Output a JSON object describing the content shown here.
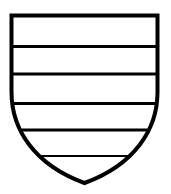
{
  "figure": {
    "name": "heraldic-shield",
    "title": "Heraldic shield with horizontal bars",
    "blazon_description": "Escutcheon barry of seven",
    "background_color": "#ffffff",
    "field_color": "#ffffff",
    "outline_color": "#000000",
    "bar_color": "#000000",
    "canvas": {
      "width": 171,
      "height": 194
    },
    "shield_geometry": {
      "top_y": 15.5,
      "left_x": 11.5,
      "right_x": 157.5,
      "point_x": 84.5,
      "point_y": 183,
      "outline_stroke_width": 4,
      "side_curve_control_x_left": 14,
      "side_curve_control_x_right": 155,
      "side_curve_control_y": 140,
      "path": "M 11.5 15.5 L 157.5 15.5 L 157.5 92 C 157.5 130 134 165 84.5 183 C 35 165 11.5 130 11.5 92 Z"
    },
    "bars": [
      {
        "label": "bar-1",
        "y": 46.5,
        "stroke_width": 3,
        "x_left": 11.5,
        "x_right": 157.5
      },
      {
        "label": "bar-2",
        "y": 74.0,
        "stroke_width": 3,
        "x_left": 11.5,
        "x_right": 157.5
      },
      {
        "label": "bar-3",
        "y": 103.5,
        "stroke_width": 3,
        "x_left": 13.0,
        "x_right": 156.0
      },
      {
        "label": "bar-4",
        "y": 130.0,
        "stroke_width": 3,
        "x_left": 22.0,
        "x_right": 147.0
      },
      {
        "label": "bar-5",
        "y": 156.0,
        "stroke_width": 2,
        "x_left": 40.0,
        "x_right": 129.0
      }
    ],
    "division_count": 6,
    "bar_count": 5,
    "accessible_label": "Black and white line drawing of a shield divided by five horizontal bars"
  }
}
